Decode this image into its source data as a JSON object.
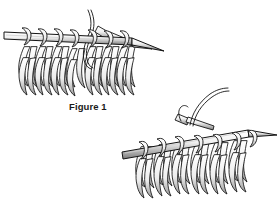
{
  "page": {
    "background_color": "#ffffff",
    "width": 279,
    "height": 208,
    "ink_color": "#111111",
    "shade_color": "#6b6b6b"
  },
  "caption": {
    "figure_1": "Figure 1"
  },
  "illustrations": [
    {
      "id": "knitting-needle-top",
      "name": "knitting-needles-stitches-upper",
      "description": "Line drawing of a knitting needle held horizontally with a row of knit stitches hanging below it; a second needle crosses in from the upper right and a free yarn strand curves up from the center.",
      "element_count": 10,
      "needle_count": 2,
      "stitch_count": 10
    },
    {
      "id": "knitting-needle-bottom",
      "name": "knitting-needles-stitches-lower",
      "description": "Line drawing of a knitting needle angled slightly down to the left with a row of knit stitches hanging below it; a working yarn strand curves up and to the right.",
      "element_count": 11,
      "needle_count": 2,
      "stitch_count": 11
    }
  ]
}
